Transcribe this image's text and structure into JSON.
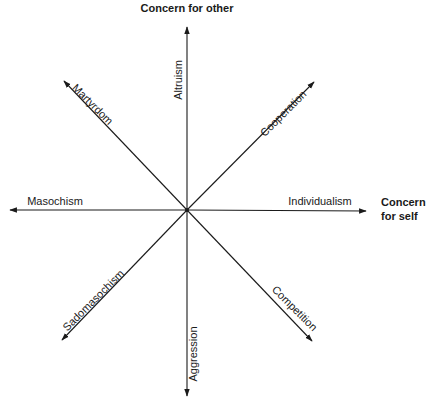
{
  "diagram": {
    "axes": {
      "vertical_label": "Concern for other",
      "horizontal_label_line1": "Concern",
      "horizontal_label_line2": "for self"
    },
    "center": {
      "x": 187,
      "y": 210
    },
    "arrows": [
      {
        "id": "altruism",
        "label": "Altruism",
        "direction": "up"
      },
      {
        "id": "cooperation",
        "label": "Cooperation",
        "direction": "up-right"
      },
      {
        "id": "individualism",
        "label": "Individualism",
        "direction": "right"
      },
      {
        "id": "competition",
        "label": "Competition",
        "direction": "down-right"
      },
      {
        "id": "aggression",
        "label": "Aggression",
        "direction": "down"
      },
      {
        "id": "sadomasochism",
        "label": "Sadomasochism",
        "direction": "down-left"
      },
      {
        "id": "masochism",
        "label": "Masochism",
        "direction": "left"
      },
      {
        "id": "martyrdom",
        "label": "Martyrdom",
        "direction": "up-left"
      }
    ],
    "line_color": "#1a1a1a"
  }
}
